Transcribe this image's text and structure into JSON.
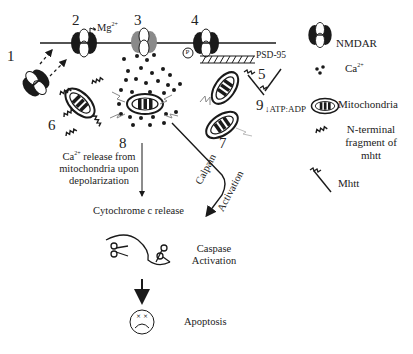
{
  "diagram": {
    "numbers": [
      "1",
      "2",
      "3",
      "4",
      "5",
      "6",
      "7",
      "8",
      "9"
    ],
    "mg_label": "Mg",
    "mg_sup": "2+",
    "phospho_label": "P",
    "psd95_label": "PSD-95",
    "atp_label": "ATP:ADP",
    "atp_arrow": "↓",
    "ca_release_label_prefix": "Ca",
    "ca_release_sup": "2+",
    "ca_release_label_rest": " release from mitochondria upon depolarization",
    "cytochrome_label": "Cytochrome c release",
    "calpain_label": "Calpain",
    "activation_label": "Activation",
    "caspase_label": "Caspase Activation",
    "apoptosis_label": "Apoptosis"
  },
  "legend": {
    "items": [
      {
        "icon": "nmdar-icon",
        "label": "NMDAR"
      },
      {
        "icon": "calcium-icon",
        "label": "Ca",
        "sup": "2+"
      },
      {
        "icon": "mitochondria-icon",
        "label": "Mitochondria"
      },
      {
        "icon": "n-terminal-fragment-icon",
        "label": "N-terminal fragment of mhtt"
      },
      {
        "icon": "mhtt-icon",
        "label": "Mhtt"
      }
    ]
  },
  "colors": {
    "ink": "#1a1a1a",
    "grey_receptor": "#8a8a8a",
    "background": "#ffffff"
  }
}
